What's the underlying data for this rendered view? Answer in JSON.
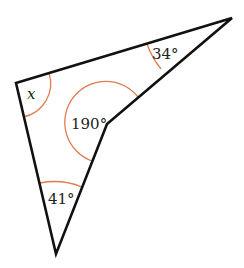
{
  "figure": {
    "type": "concave-quadrilateral",
    "colors": {
      "edge": "#111111",
      "angle_arc": "#e07a4f",
      "label": "#222222",
      "background": "#ffffff"
    },
    "vertices": {
      "top_left": [
        16,
        83
      ],
      "top_right": [
        232,
        18
      ],
      "reflex": [
        107,
        124
      ],
      "bottom": [
        56,
        254
      ]
    },
    "angles": [
      {
        "vertex": "top_left",
        "label": "x",
        "kind": "unknown"
      },
      {
        "vertex": "top_right",
        "label": "34°",
        "kind": "given"
      },
      {
        "vertex": "reflex",
        "label": "190°",
        "kind": "given-reflex"
      },
      {
        "vertex": "bottom",
        "label": "41°",
        "kind": "given"
      }
    ]
  }
}
